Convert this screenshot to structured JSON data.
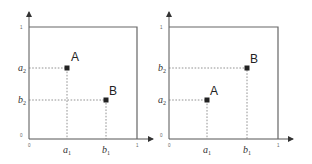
{
  "panels": [
    {
      "id": "left",
      "tick_labels": {
        "origin_y": "0",
        "origin_x": "0",
        "y_max": "1",
        "x_max": "1"
      },
      "points": [
        {
          "label": "A",
          "x_label": "a",
          "x_sub": "1",
          "y_label": "a",
          "y_sub": "2"
        },
        {
          "label": "B",
          "x_label": "b",
          "x_sub": "1",
          "y_label": "b",
          "y_sub": "2"
        }
      ]
    },
    {
      "id": "right",
      "tick_labels": {
        "origin_y": "0",
        "origin_x": "0",
        "y_max": "1",
        "x_max": "1"
      },
      "points": [
        {
          "label": "A",
          "x_label": "a",
          "x_sub": "1",
          "y_label": "a",
          "y_sub": "2"
        },
        {
          "label": "B",
          "x_label": "b",
          "x_sub": "1",
          "y_label": "b",
          "y_sub": "2"
        }
      ]
    }
  ],
  "colors": {
    "axis": "#555555",
    "box": "#666666",
    "point": "#222222",
    "guide": "#777777"
  }
}
